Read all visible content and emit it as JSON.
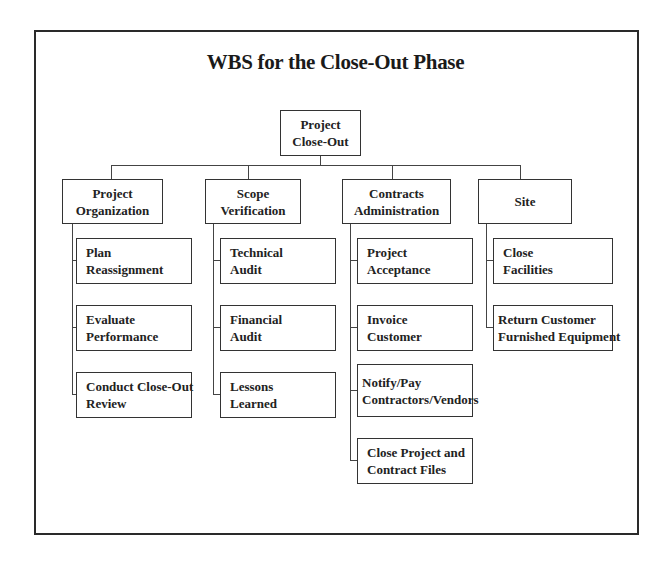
{
  "title": "WBS for the Close-Out Phase",
  "root": {
    "line1": "Project",
    "line2": "Close-Out"
  },
  "branches": [
    {
      "line1": "Project",
      "line2": "Organization",
      "children": [
        {
          "line1": "Plan",
          "line2": "Reassignment"
        },
        {
          "line1": "Evaluate",
          "line2": "Performance"
        },
        {
          "line1": "Conduct Close-Out",
          "line2": "Review"
        }
      ]
    },
    {
      "line1": "Scope",
      "line2": "Verification",
      "children": [
        {
          "line1": "Technical",
          "line2": "Audit"
        },
        {
          "line1": "Financial",
          "line2": "Audit"
        },
        {
          "line1": "Lessons",
          "line2": "Learned"
        }
      ]
    },
    {
      "line1": "Contracts",
      "line2": "Administration",
      "children": [
        {
          "line1": "Project",
          "line2": "Acceptance"
        },
        {
          "line1": "Invoice",
          "line2": "Customer"
        },
        {
          "line1": "Notify/Pay",
          "line2": "Contractors/Vendors"
        },
        {
          "line1": "Close Project and",
          "line2": "Contract Files"
        }
      ]
    },
    {
      "line1": "Site",
      "line2": "",
      "children": [
        {
          "line1": "Close",
          "line2": "Facilities"
        },
        {
          "line1": "Return Customer",
          "line2": "Furnished Equipment"
        }
      ]
    }
  ]
}
